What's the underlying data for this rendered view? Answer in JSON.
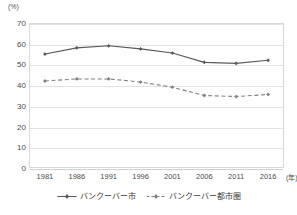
{
  "chart_data": {
    "type": "line",
    "title": "",
    "subtitle": "",
    "xlabel": "年",
    "ylabel": "%",
    "x": [
      1981,
      1986,
      1991,
      1996,
      2001,
      2006,
      2011,
      2016
    ],
    "categories": [
      "1981",
      "1986",
      "1991",
      "1996",
      "2001",
      "2006",
      "2011",
      "2016"
    ],
    "series": [
      {
        "name": "バンクーバー市",
        "style": "solid",
        "color": "#595959",
        "marker": "diamond",
        "values": [
          55.0,
          58.0,
          59.0,
          57.5,
          55.5,
          51.0,
          50.5,
          52.0
        ]
      },
      {
        "name": "バンクーバー都市圏",
        "style": "dashed",
        "color": "#7f7f7f",
        "marker": "diamond",
        "values": [
          42.0,
          43.0,
          43.0,
          41.5,
          39.0,
          35.0,
          34.5,
          35.5
        ]
      }
    ],
    "ylim": [
      0,
      70
    ],
    "yticks": [
      0,
      10,
      20,
      30,
      40,
      50,
      60,
      70
    ],
    "ytick_labels": [
      "0",
      "10",
      "20",
      "30",
      "40",
      "50",
      "60",
      "70"
    ],
    "grid": true,
    "legend_position": "bottom"
  },
  "axis": {
    "unit_label": "(%)",
    "x_unit_label": "(年)"
  },
  "legend": {
    "items": [
      {
        "label": "バンクーバー市"
      },
      {
        "label": "バンクーバー都市圏"
      }
    ]
  }
}
